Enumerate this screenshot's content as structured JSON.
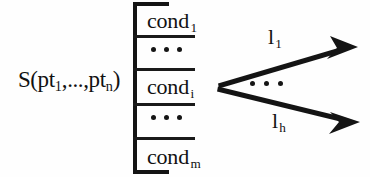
{
  "figure": {
    "kind": "rule-schema-diagram",
    "background_color": "#fefefe",
    "ink_color": "#141414"
  },
  "lhs": {
    "head": "S(pt",
    "sub_first": "1",
    "middle": ",...,pt",
    "sub_last": "n",
    "tail": ")",
    "full_text": "S(pt1,...,ptn)"
  },
  "bracket": {
    "rows": [
      {
        "type": "condition",
        "text": "cond",
        "subscript": "1"
      },
      {
        "type": "ellipsis",
        "dots": 3
      },
      {
        "type": "condition",
        "text": "cond",
        "subscript": "i"
      },
      {
        "type": "ellipsis",
        "dots": 3
      },
      {
        "type": "condition",
        "text": "cond",
        "subscript": "m"
      }
    ],
    "separator_count": 4
  },
  "arrows": {
    "origin": {
      "x": 218,
      "y": 85
    },
    "items": [
      {
        "name": "upper-arrow",
        "label_text": "l",
        "label_subscript": "1",
        "tip": {
          "x": 358,
          "y": 47
        }
      },
      {
        "name": "lower-arrow",
        "label_text": "l",
        "label_subscript": "h",
        "tip": {
          "x": 360,
          "y": 122
        }
      }
    ],
    "between_ellipsis": {
      "dots": 3
    }
  }
}
